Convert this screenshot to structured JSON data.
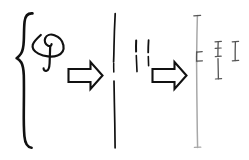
{
  "figure": {
    "title": "Hand-drawn transformation sequence",
    "background_color": "#ffffff",
    "ink_color_dark": "#111111",
    "ink_color_mid": "#555555",
    "ink_color_light": "#a8a8a8",
    "width": 249,
    "height": 160
  },
  "stages": [
    {
      "id": "stage-1",
      "name": "braced-coil",
      "label": "",
      "elements": [
        {
          "name": "curly-brace",
          "kind": "brace",
          "x": 22,
          "y_top": 13,
          "y_bottom": 148
        },
        {
          "name": "coil-loop",
          "kind": "spiral",
          "cx": 45,
          "cy": 47
        }
      ]
    },
    {
      "id": "stage-2",
      "name": "vertical-strokes",
      "label": "",
      "elements": [
        {
          "name": "long-vertical-line",
          "kind": "line",
          "x": 114,
          "y_top": 13,
          "y_bottom": 148
        },
        {
          "name": "short-stroke-left",
          "kind": "line",
          "x": 136,
          "y_top": 40,
          "y_bottom": 72
        },
        {
          "name": "short-stroke-right",
          "kind": "line",
          "x": 148,
          "y_top": 40,
          "y_bottom": 66
        }
      ]
    },
    {
      "id": "stage-3",
      "name": "ticked-axis",
      "label": "",
      "elements": [
        {
          "name": "faint-long-vertical-line",
          "kind": "line",
          "x": 197,
          "y_top": 15,
          "y_bottom": 148
        },
        {
          "name": "axis-tick-top",
          "kind": "tick",
          "x": 197,
          "y": 16
        },
        {
          "name": "axis-tick-middle-upper",
          "kind": "tick",
          "x": 197,
          "y": 52
        },
        {
          "name": "axis-tick-middle-lower",
          "kind": "tick",
          "x": 197,
          "y": 61
        },
        {
          "name": "axis-tick-bottom",
          "kind": "tick",
          "x": 197,
          "y": 147
        },
        {
          "name": "bracket-segment-tall",
          "kind": "bracket",
          "x": 218,
          "y_top": 41,
          "y_bottom": 79
        },
        {
          "name": "bracket-segment-short",
          "kind": "bracket",
          "x": 235,
          "y_top": 41,
          "y_bottom": 61
        }
      ]
    }
  ],
  "arrows": [
    {
      "id": "arrow-1",
      "name": "transform-arrow-first",
      "direction": "right",
      "x": 68,
      "y": 60,
      "width": 34,
      "height": 30,
      "label": ""
    },
    {
      "id": "arrow-2",
      "name": "transform-arrow-second",
      "direction": "right",
      "x": 152,
      "y": 60,
      "width": 34,
      "height": 30,
      "label": ""
    }
  ]
}
